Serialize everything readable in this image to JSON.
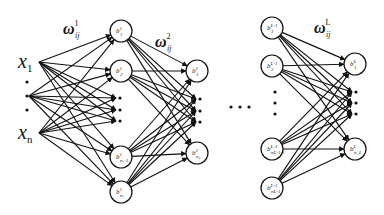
{
  "diagram": {
    "colors": {
      "stroke": "#111111",
      "background": "#ffffff",
      "node_fill": "#ffffff"
    },
    "inputs": [
      {
        "id": "x1",
        "label": "x",
        "sub": "1",
        "x": 33,
        "y": 62
      },
      {
        "id": "xn",
        "label": "x",
        "sub": "n",
        "x": 33,
        "y": 133
      }
    ],
    "input_dots": [
      {
        "x": 27,
        "y": 82
      },
      {
        "x": 27,
        "y": 96
      },
      {
        "x": 27,
        "y": 110
      }
    ],
    "layers": [
      {
        "name": "layer-1",
        "weight_label": {
          "base": "ω",
          "sub": "ij",
          "sup": "1",
          "x": 63,
          "y": 34
        },
        "nodes": [
          {
            "id": "b1_1",
            "base": "b",
            "sup": "1",
            "sub": "1",
            "x": 121,
            "y": 31
          },
          {
            "id": "b2_1",
            "base": "b",
            "sup": "1",
            "sub": "2",
            "x": 121,
            "y": 71
          },
          {
            "id": "bn1m1_1",
            "base": "b",
            "sup": "1",
            "sub": "n₁-1",
            "x": 121,
            "y": 157
          },
          {
            "id": "bn1_1",
            "base": "b",
            "sup": "1",
            "sub": "n₁",
            "x": 121,
            "y": 192
          }
        ],
        "dots": [
          {
            "x": 120,
            "y": 98
          },
          {
            "x": 120,
            "y": 110
          },
          {
            "x": 120,
            "y": 121
          }
        ]
      },
      {
        "name": "layer-2",
        "weight_label": {
          "base": "ω",
          "sub": "ij",
          "sup": "2",
          "x": 155,
          "y": 47
        },
        "nodes": [
          {
            "id": "b1_2",
            "base": "b",
            "sup": "2",
            "sub": "1",
            "x": 197,
            "y": 71
          },
          {
            "id": "bn2_2",
            "base": "b",
            "sup": "2",
            "sub": "n₂",
            "x": 197,
            "y": 153
          }
        ],
        "dots": [
          {
            "x": 200,
            "y": 99
          },
          {
            "x": 200,
            "y": 111
          },
          {
            "x": 200,
            "y": 122
          }
        ]
      },
      {
        "name": "layer-L-1",
        "nodes": [
          {
            "id": "b1_Lm1",
            "base": "b",
            "sup": "L-1",
            "sub": "1",
            "x": 272,
            "y": 28
          },
          {
            "id": "b2_Lm1",
            "base": "b",
            "sup": "L-1",
            "sub": "2",
            "x": 272,
            "y": 66
          },
          {
            "id": "bnm1_Lm1",
            "base": "b",
            "sup": "L-1",
            "sub": "n_{L-1}-1",
            "x": 272,
            "y": 149
          },
          {
            "id": "bn_Lm1",
            "base": "b",
            "sup": "L-1",
            "sub": "n_{L-1}",
            "x": 272,
            "y": 188
          }
        ],
        "dots": [
          {
            "x": 275,
            "y": 92
          },
          {
            "x": 275,
            "y": 103
          },
          {
            "x": 275,
            "y": 114
          }
        ]
      },
      {
        "name": "layer-L",
        "weight_label": {
          "base": "ω",
          "sub": "ij",
          "sup": "L",
          "x": 314,
          "y": 33
        },
        "nodes": [
          {
            "id": "b1_L",
            "base": "b",
            "sup": "L",
            "sub": "1",
            "x": 355,
            "y": 64
          },
          {
            "id": "bn_L",
            "base": "b",
            "sup": "L",
            "sub": "n_L",
            "x": 355,
            "y": 149
          }
        ],
        "dots": [
          {
            "x": 356,
            "y": 92
          },
          {
            "x": 356,
            "y": 103
          },
          {
            "x": 356,
            "y": 114
          }
        ]
      }
    ],
    "layer_gap_ellipsis": [
      {
        "x": 231,
        "y": 107
      },
      {
        "x": 240,
        "y": 107
      },
      {
        "x": 249,
        "y": 107
      }
    ],
    "node_radius": 11
  }
}
